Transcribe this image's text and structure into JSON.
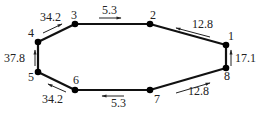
{
  "nodes": [
    {
      "id": "1",
      "x": 226,
      "y": 45,
      "lx": 228,
      "ly": 40
    },
    {
      "id": "2",
      "x": 150,
      "y": 24,
      "lx": 150,
      "ly": 19
    },
    {
      "id": "3",
      "x": 75,
      "y": 24,
      "lx": 71,
      "ly": 19
    },
    {
      "id": "4",
      "x": 38,
      "y": 42,
      "lx": 28,
      "ly": 37
    },
    {
      "id": "5",
      "x": 38,
      "y": 72,
      "lx": 28,
      "ly": 81
    },
    {
      "id": "6",
      "x": 75,
      "y": 90,
      "lx": 73,
      "ly": 84
    },
    {
      "id": "7",
      "x": 150,
      "y": 90,
      "lx": 154,
      "ly": 103
    },
    {
      "id": "8",
      "x": 226,
      "y": 68,
      "lx": 224,
      "ly": 80
    }
  ],
  "edges": [
    {
      "from": "1",
      "to": "2"
    },
    {
      "from": "2",
      "to": "3"
    },
    {
      "from": "3",
      "to": "4"
    },
    {
      "from": "4",
      "to": "5"
    },
    {
      "from": "5",
      "to": "6"
    },
    {
      "from": "6",
      "to": "7"
    },
    {
      "from": "7",
      "to": "8"
    },
    {
      "from": "8",
      "to": "1"
    }
  ],
  "flows": [
    {
      "value": "12.8",
      "x1": 210,
      "y1": 37,
      "x2": 176,
      "y2": 28,
      "tx": 192,
      "ty": 28
    },
    {
      "value": "5.3",
      "x1": 99,
      "y1": 18,
      "x2": 121,
      "y2": 18,
      "tx": 102,
      "ty": 14
    },
    {
      "value": "34.2",
      "x1": 43,
      "y1": 33,
      "x2": 62,
      "y2": 24,
      "tx": 40,
      "ty": 21
    },
    {
      "value": "37.8",
      "x1": 35,
      "y1": 66,
      "x2": 35,
      "y2": 50,
      "tx": 4,
      "ty": 62
    },
    {
      "value": "34.2",
      "x1": 66,
      "y1": 92,
      "x2": 48,
      "y2": 84,
      "tx": 42,
      "ty": 103
    },
    {
      "value": "5.3",
      "x1": 124,
      "y1": 96,
      "x2": 102,
      "y2": 96,
      "tx": 111,
      "ty": 107
    },
    {
      "value": "12.8",
      "x1": 176,
      "y1": 93,
      "x2": 210,
      "y2": 83,
      "tx": 188,
      "ty": 95
    },
    {
      "value": "17.1",
      "x1": 231,
      "y1": 66,
      "x2": 231,
      "y2": 50,
      "tx": 235,
      "ty": 62
    }
  ],
  "colors": {
    "edge": "#111111",
    "node": "#000000",
    "text": "#222222"
  }
}
